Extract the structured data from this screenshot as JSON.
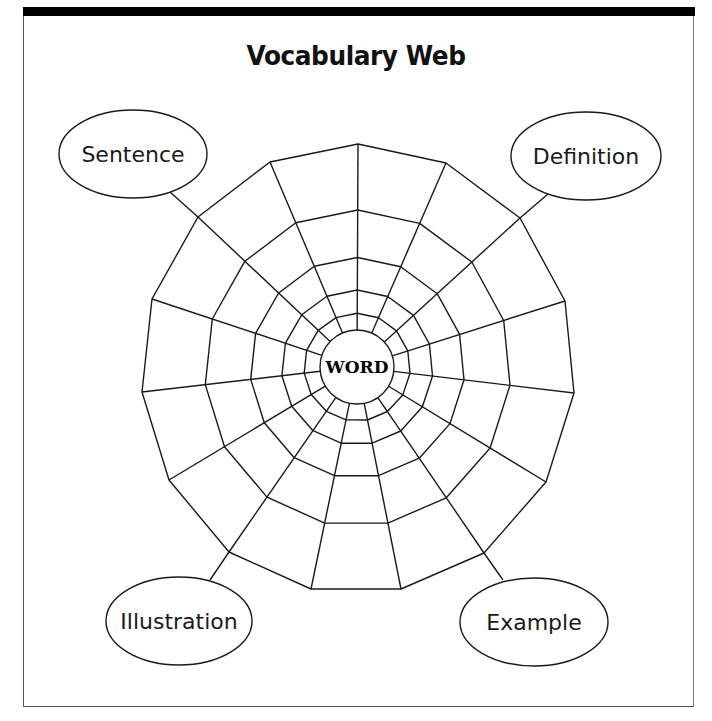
{
  "title": "Vocabulary Web",
  "center": {
    "label": "WORD",
    "cx": 357,
    "cy": 367,
    "r": 37
  },
  "ovals": [
    {
      "id": "sentence",
      "label": "Sentence",
      "cx": 133,
      "cy": 154,
      "rx": 74,
      "ry": 44,
      "line": [
        [
          170,
          192
        ],
        [
          198,
          217
        ]
      ]
    },
    {
      "id": "definition",
      "label": "Definition",
      "cx": 586,
      "cy": 156,
      "rx": 75,
      "ry": 44,
      "line": [
        [
          548,
          194
        ],
        [
          520,
          218
        ]
      ]
    },
    {
      "id": "illustration",
      "label": "Illustration",
      "cx": 179,
      "cy": 621,
      "rx": 73,
      "ry": 44,
      "line": [
        [
          210,
          580
        ],
        [
          229,
          552
        ]
      ]
    },
    {
      "id": "example",
      "label": "Example",
      "cx": 534,
      "cy": 622,
      "rx": 74,
      "ry": 44,
      "line": [
        [
          503,
          580
        ],
        [
          484,
          553
        ]
      ]
    }
  ],
  "web": {
    "outer_vertices": [
      [
        358,
        144
      ],
      [
        446,
        163
      ],
      [
        520,
        218
      ],
      [
        565,
        301
      ],
      [
        574,
        393
      ],
      [
        546,
        482
      ],
      [
        484,
        553
      ],
      [
        401,
        589
      ],
      [
        311,
        589
      ],
      [
        229,
        552
      ],
      [
        169,
        480
      ],
      [
        142,
        392
      ],
      [
        152,
        299
      ],
      [
        198,
        217
      ],
      [
        270,
        162
      ]
    ],
    "ring_fractions": [
      0,
      0.09,
      0.215,
      0.39,
      0.645,
      1
    ],
    "stroke": "#1a1a1a"
  }
}
